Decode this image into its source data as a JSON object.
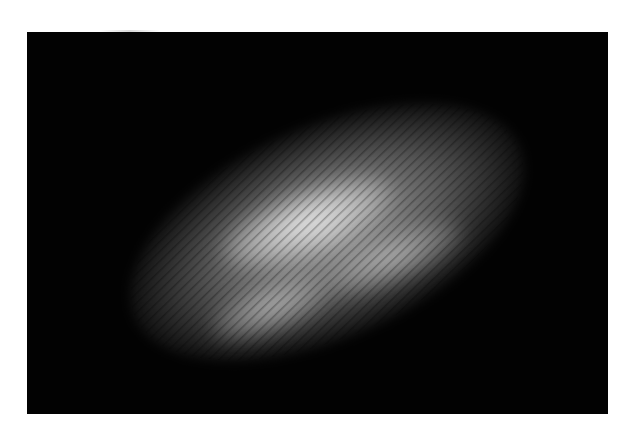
{
  "image": {
    "description": "Grayscale photograph of a diagonal elongated bright speckle/interference fringe pattern on a black background",
    "background_color": "#ffffff",
    "frame_color": "#020202",
    "highlight_color": "#e6e6e6"
  }
}
